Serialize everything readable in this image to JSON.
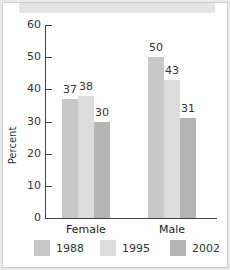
{
  "chart_data": {
    "type": "bar",
    "title": "",
    "xlabel": "",
    "ylabel": "Percent",
    "ylim": [
      0,
      60
    ],
    "yticks": [
      0,
      10,
      20,
      30,
      40,
      50,
      60
    ],
    "categories": [
      "Female",
      "Male"
    ],
    "series": [
      {
        "name": "1988",
        "values": [
          37,
          50
        ],
        "color": "#c8c8c8"
      },
      {
        "name": "1995",
        "values": [
          38,
          43
        ],
        "color": "#dcdcdc"
      },
      {
        "name": "2002",
        "values": [
          30,
          31
        ],
        "color": "#b4b4b4"
      }
    ],
    "legend_position": "bottom",
    "grid": false
  },
  "labels": {
    "ylabel": "Percent",
    "ticks": [
      "0",
      "10",
      "20",
      "30",
      "40",
      "50",
      "60"
    ],
    "categories": [
      "Female",
      "Male"
    ],
    "legend": [
      "1988",
      "1995",
      "2002"
    ],
    "values": {
      "female": [
        "37",
        "38",
        "30"
      ],
      "male": [
        "50",
        "43",
        "31"
      ]
    }
  }
}
